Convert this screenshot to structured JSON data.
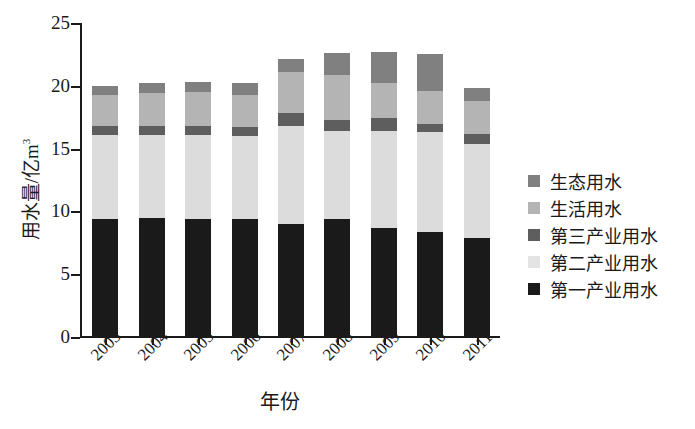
{
  "chart_data": {
    "type": "bar",
    "stacked": true,
    "title": "",
    "xlabel": "年份",
    "ylabel": "用水量/亿m³",
    "ylabel_base": "用水量/亿m",
    "ylabel_sup": "3",
    "categories": [
      "2003",
      "2004",
      "2005",
      "2006",
      "2007",
      "2008",
      "2009",
      "2010",
      "2011"
    ],
    "ylim": [
      0,
      25
    ],
    "yticks": [
      0,
      5,
      10,
      15,
      20,
      25
    ],
    "ytick_labels": [
      "0",
      "5",
      "10",
      "15",
      "20",
      "25"
    ],
    "grid": false,
    "legend_position": "right",
    "series": [
      {
        "name": "第一产业用水",
        "color": "#1a1a1a",
        "values": [
          9.4,
          9.5,
          9.4,
          9.4,
          9.0,
          9.4,
          8.7,
          8.4,
          7.9
        ]
      },
      {
        "name": "第二产业用水",
        "color": "#dcdcdc",
        "values": [
          6.7,
          6.6,
          6.7,
          6.6,
          7.8,
          7.0,
          7.7,
          7.9,
          7.5
        ]
      },
      {
        "name": "第三产业用水",
        "color": "#5e5e5e",
        "values": [
          0.7,
          0.7,
          0.7,
          0.7,
          1.0,
          0.9,
          1.0,
          0.7,
          0.8
        ]
      },
      {
        "name": "生活用水",
        "color": "#b4b4b4",
        "values": [
          2.5,
          2.6,
          2.7,
          2.6,
          3.3,
          3.6,
          2.8,
          2.6,
          2.6
        ]
      },
      {
        "name": "生态用水",
        "color": "#808080",
        "values": [
          0.7,
          0.8,
          0.8,
          0.9,
          1.0,
          1.7,
          2.5,
          2.9,
          1.0
        ]
      }
    ],
    "totals": [
      20.0,
      20.2,
      20.3,
      20.2,
      22.1,
      22.6,
      22.7,
      22.5,
      19.8
    ]
  },
  "legend": {
    "items": [
      {
        "label": "生态用水",
        "color": "#808080"
      },
      {
        "label": "生活用水",
        "color": "#b4b4b4"
      },
      {
        "label": "第三产业用水",
        "color": "#5e5e5e"
      },
      {
        "label": "第二产业用水",
        "color": "#e4e4e4"
      },
      {
        "label": "第一产业用水",
        "color": "#1a1a1a"
      }
    ]
  }
}
